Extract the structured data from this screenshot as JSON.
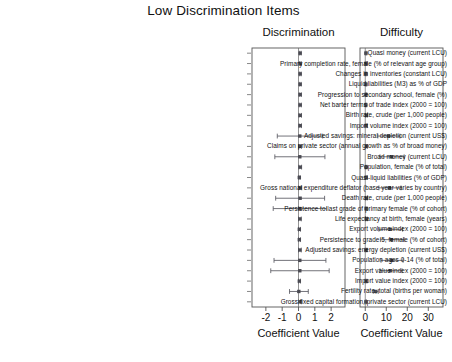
{
  "chart_data": {
    "type": "scatter",
    "title": "Low Discrimination Items",
    "layout": "two horizontal panels, shared categorical y-axis, point estimates with horizontal 95% error bars",
    "grid": false,
    "legend": "none",
    "categories": [
      "Quasi money (current LCU)",
      "Primary completion rate, female (% of relevant age group)",
      "Changes in inventories (constant LCU)",
      "Liquid liabilities (M3) as % of GDP",
      "Progression to secondary school, female (%)",
      "Net barter terms of trade index (2000 = 100)",
      "Birth rate, crude (per 1,000 people)",
      "Import volume index (2000 = 100)",
      "Adjusted savings: mineral depletion (current US$)",
      "Claims on private sector (annual growth as % of broad money)",
      "Broad money (current LCU)",
      "Population, female (% of total)",
      "Quasi-liquid liabilities (% of GDP)",
      "Gross national expenditure deflator (base year varies by country)",
      "Death rate, crude (per 1,000 people)",
      "Persistence to last grade of primary female (% of cohort)",
      "Life expectancy at birth, female (years)",
      "Export volume index (2000 = 100)",
      "Persistence to grade 5, female (% of cohort)",
      "Adjusted savings: energy depletion (current US$)",
      "Population ages 0-14 (% of total)",
      "Export value index (2000 = 100)",
      "Import value index (2000 = 100)",
      "Fertility rate, total (births per woman)",
      "Gross fixed capital formation, private sector (current LCU)"
    ],
    "panels": [
      {
        "name": "discrimination",
        "title": "Discrimination",
        "xlabel": "Coefficient Value",
        "xlim": [
          -2.85,
          2.85
        ],
        "ticks": [
          -2,
          -1,
          0,
          1,
          2
        ],
        "tick_labels": [
          "-2",
          "-1",
          "0",
          "1",
          "2"
        ],
        "values": [
          0.1,
          0.1,
          0.1,
          0.1,
          0.1,
          0.1,
          0.1,
          0.1,
          0.08,
          0.08,
          0.08,
          0.1,
          0.05,
          0.1,
          0.1,
          0.08,
          0.08,
          0.05,
          0.05,
          0.08,
          0.08,
          0.08,
          0.05,
          0.02,
          0.08
        ],
        "lower": [
          0.05,
          0.05,
          0.05,
          0.05,
          0.04,
          0.04,
          0.03,
          0.03,
          -1.3,
          0.02,
          -1.45,
          0.02,
          0.01,
          0.01,
          -1.4,
          -1.55,
          0.0,
          0.0,
          0.0,
          0.0,
          -1.5,
          -1.7,
          0.0,
          -0.55,
          0.0
        ],
        "upper": [
          0.16,
          0.16,
          0.16,
          0.16,
          0.17,
          0.17,
          0.18,
          0.18,
          1.48,
          0.18,
          1.62,
          0.19,
          0.1,
          0.2,
          1.6,
          1.72,
          0.17,
          0.12,
          0.12,
          0.17,
          1.68,
          1.88,
          0.12,
          0.6,
          0.18
        ]
      },
      {
        "name": "difficulty",
        "title": "Difficulty",
        "xlabel": "Coefficient Value",
        "xlim": [
          -2.5,
          37
        ],
        "ticks": [
          0,
          10,
          20,
          30
        ],
        "tick_labels": [
          "0",
          "10",
          "20",
          "30"
        ],
        "values": [
          0.3,
          0.3,
          0.3,
          0.3,
          0.3,
          0.3,
          0.5,
          0.4,
          11.0,
          0.6,
          12.5,
          0.4,
          0.4,
          11.5,
          0.5,
          0.4,
          0.5,
          12.0,
          12.5,
          0.4,
          12.5,
          12.0,
          0.4,
          5.0,
          0.3
        ],
        "lower": [
          0.0,
          0.0,
          0.0,
          0.0,
          0.0,
          0.0,
          0.1,
          0.0,
          6.0,
          0.2,
          7.0,
          0.0,
          0.0,
          6.5,
          0.1,
          0.0,
          0.1,
          6.5,
          7.2,
          0.0,
          7.5,
          7.0,
          0.0,
          3.8,
          0.0
        ],
        "upper": [
          0.7,
          0.7,
          0.7,
          0.7,
          0.7,
          0.7,
          0.9,
          0.8,
          16.5,
          1.0,
          18.5,
          0.8,
          0.8,
          17.0,
          0.9,
          0.8,
          0.9,
          17.8,
          18.5,
          0.8,
          18.0,
          17.5,
          0.8,
          6.2,
          0.6
        ]
      }
    ]
  },
  "style": {
    "point_color": "#4a4a52",
    "bar_color": "#5a5a62",
    "frame_color": "#555555",
    "text_color": "#111111"
  }
}
